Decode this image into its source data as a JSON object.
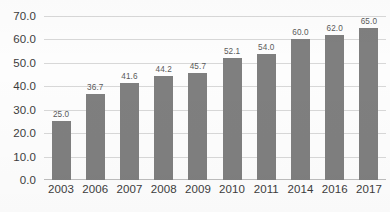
{
  "chart_data": {
    "type": "bar",
    "title": "",
    "subtitle": "",
    "xlabel": "",
    "ylabel": "",
    "categories": [
      "2003",
      "2006",
      "2007",
      "2008",
      "2009",
      "2010",
      "2011",
      "2014",
      "2016",
      "2017"
    ],
    "values": [
      25.0,
      36.7,
      41.6,
      44.2,
      45.7,
      52.1,
      54.0,
      60.0,
      62.0,
      65.0
    ],
    "data_labels": [
      "25.0",
      "36.7",
      "41.6",
      "44.2",
      "45.7",
      "52.1",
      "54.0",
      "60.0",
      "62.0",
      "65.0"
    ],
    "ylim": [
      0,
      70
    ],
    "y_ticks": [
      0,
      10,
      20,
      30,
      40,
      50,
      60,
      70
    ],
    "y_tick_labels": [
      "0.0",
      "10.0",
      "20.0",
      "30.0",
      "40.0",
      "50.0",
      "60.0",
      "70.0"
    ],
    "grid": true,
    "grid_axis": "y",
    "legend": false,
    "legend_position": "none",
    "series": [
      {
        "name": "",
        "values": [
          25.0,
          36.7,
          41.6,
          44.2,
          45.7,
          52.1,
          54.0,
          60.0,
          62.0,
          65.0
        ]
      }
    ]
  },
  "colors": {
    "bar": "#7f7f7f",
    "gridline": "#d8d8d8",
    "axis": "#bdbdbd",
    "tick_text": "#3c3c3c",
    "value_text": "#5a5a5a",
    "background": "#fdfdfd"
  }
}
